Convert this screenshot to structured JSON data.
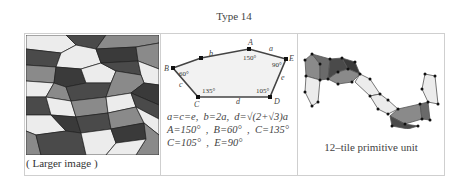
{
  "title": "Type 14",
  "cells": [
    {
      "name": "tiling-preview",
      "image_alt": "Type 14 pentagon tiling",
      "link_label": "( Larger image )",
      "tile_colors": {
        "light": "#ececec",
        "mid": "#8a8a8a",
        "dark": "#4a4a4a",
        "darker": "#3a3a3a",
        "edge": "#222222"
      }
    },
    {
      "name": "pentagon-diagram",
      "vertex_labels": {
        "A": "A",
        "B": "B",
        "C": "C",
        "D": "D",
        "E": "E"
      },
      "edge_labels": {
        "a": "a",
        "b": "b",
        "c": "c",
        "d": "d",
        "e": "e"
      },
      "angle_labels": {
        "A": "150°",
        "B": "60°",
        "C": "135°",
        "D": "105°",
        "E": "90°"
      },
      "formula_lines": [
        "a=c=e,  b=2a,  d=√(2+√3)a",
        "A=150°  ,  B=60°  ,  C=135°",
        "C=105°  ,  E=90°"
      ],
      "fill_color": "#f2f2f2",
      "edge_color": "#444444"
    },
    {
      "name": "primitive-unit",
      "caption": "12–tile primitive unit"
    }
  ]
}
